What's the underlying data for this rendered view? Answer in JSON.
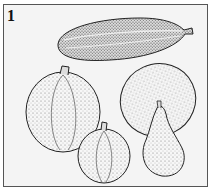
{
  "figure": {
    "label": "1",
    "items": [
      {
        "name": "elongated zucchini-like squash"
      },
      {
        "name": "round ribbed pumpkin (left)"
      },
      {
        "name": "small ribbed gourd (center bottom)"
      },
      {
        "name": "large oval squash (right)"
      },
      {
        "name": "pear-shaped gourd (right bottom)"
      }
    ]
  }
}
